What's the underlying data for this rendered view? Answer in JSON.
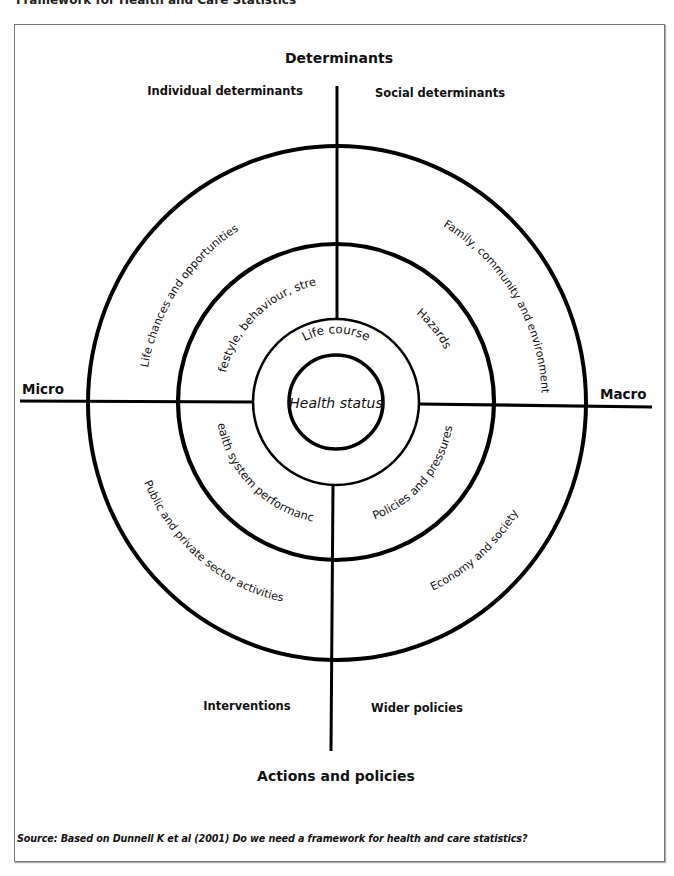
{
  "page": {
    "title": "Framework for Health and Care Statistics"
  },
  "diagram": {
    "top_heading": "Determinants",
    "bottom_heading": "Actions and policies",
    "left_axis": "Micro",
    "right_axis": "Macro",
    "quadrant_labels": {
      "top_left": "Individual determinants",
      "top_right": "Social determinants",
      "bottom_left": "Interventions",
      "bottom_right": "Wider policies"
    },
    "center": "Health status",
    "ring1": {
      "top": "Life course"
    },
    "ring2": {
      "top_left": "Lifestyle, behaviour, stress",
      "top_right": "Hazards",
      "bottom_left": "Health system performance",
      "bottom_right": "Policies and pressures"
    },
    "ring3": {
      "top_left": "Life chances and opportunities",
      "top_right": "Family, community and environment",
      "bottom_left": "Public and private sector activities",
      "bottom_right": "Economy and society"
    },
    "colors": {
      "stroke": "#000000",
      "text": "#111111",
      "frame": "#777777"
    }
  },
  "footer": {
    "source": "Source: Based on Dunnell K et al (2001) Do we need a framework for health and care statistics?"
  }
}
